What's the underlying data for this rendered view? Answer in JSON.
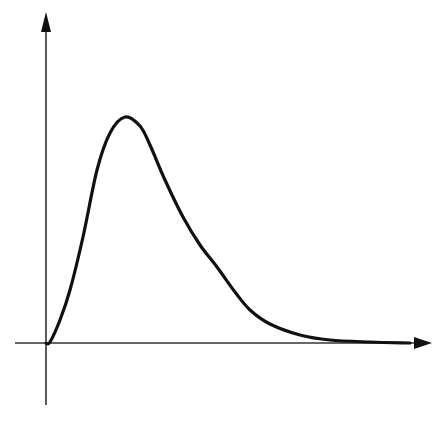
{
  "chart_data": {
    "type": "line",
    "title": "",
    "xlabel": "",
    "ylabel": "",
    "grid": false,
    "legend": null,
    "x_tick_labels": [],
    "y_tick_labels": [],
    "series": [
      {
        "name": "curve",
        "color": "#111111",
        "points_pixel": [
          [
            46,
            343
          ],
          [
            50,
            342
          ],
          [
            60,
            320
          ],
          [
            70,
            290
          ],
          [
            83,
            237
          ],
          [
            97,
            170
          ],
          [
            110,
            133
          ],
          [
            125,
            117
          ],
          [
            140,
            126
          ],
          [
            150,
            145
          ],
          [
            165,
            180
          ],
          [
            183,
            217
          ],
          [
            200,
            245
          ],
          [
            217,
            267
          ],
          [
            235,
            292
          ],
          [
            250,
            310
          ],
          [
            270,
            324
          ],
          [
            300,
            335
          ],
          [
            330,
            340
          ],
          [
            370,
            342
          ],
          [
            410,
            343
          ]
        ],
        "x": [
          0,
          0.1,
          0.36,
          0.62,
          0.96,
          1.32,
          1.66,
          2.05,
          2.44,
          2.7,
          3.09,
          3.56,
          4.0,
          4.44,
          4.91,
          5.3,
          5.82,
          6.6,
          7.38,
          8.42,
          9.46
        ],
        "y": [
          0,
          0.004,
          0.1,
          0.23,
          0.47,
          0.77,
          0.93,
          1.0,
          0.96,
          0.88,
          0.73,
          0.56,
          0.44,
          0.34,
          0.23,
          0.15,
          0.08,
          0.04,
          0.013,
          0.004,
          0
        ]
      }
    ],
    "xlim": [
      0,
      10
    ],
    "ylim": [
      -0.4,
      1.5
    ],
    "axes": {
      "origin_px": [
        46,
        343
      ],
      "x_axis_px": {
        "from": [
          15,
          343
        ],
        "to": [
          430,
          343
        ],
        "arrow": true
      },
      "y_axis_px": {
        "from": [
          46,
          405
        ],
        "to": [
          46,
          15
        ],
        "arrow": true
      }
    }
  }
}
